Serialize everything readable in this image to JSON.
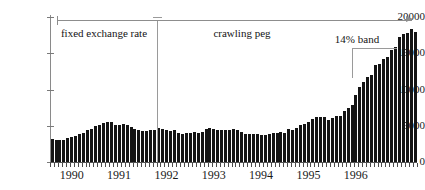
{
  "chart_data": {
    "type": "bar",
    "title": "",
    "subtitle": "",
    "xlabel": "",
    "ylabel": "",
    "xlim_labels": [
      "1990",
      "1996"
    ],
    "ylim": [
      0,
      20000
    ],
    "grid": false,
    "legend_position": "none",
    "y_ticks": [
      0,
      5000,
      10000,
      15000,
      20000
    ],
    "y_tick_labels": [
      "0",
      "5000",
      "10000",
      "15000",
      "20000"
    ],
    "x_tick_labels": [
      "1990",
      "1991",
      "1992",
      "1993",
      "1994",
      "1995",
      "1996"
    ],
    "x_tick_index": [
      0,
      12,
      24,
      36,
      48,
      60,
      72
    ],
    "bar_color": "#141414",
    "frequency": "monthly",
    "n_points": 80,
    "categories": [
      "1990-01",
      "1990-02",
      "1990-03",
      "1990-04",
      "1990-05",
      "1990-06",
      "1990-07",
      "1990-08",
      "1990-09",
      "1990-10",
      "1990-11",
      "1990-12",
      "1991-01",
      "1991-02",
      "1991-03",
      "1991-04",
      "1991-05",
      "1991-06",
      "1991-07",
      "1991-08",
      "1991-09",
      "1991-10",
      "1991-11",
      "1991-12",
      "1992-01",
      "1992-02",
      "1992-03",
      "1992-04",
      "1992-05",
      "1992-06",
      "1992-07",
      "1992-08",
      "1992-09",
      "1992-10",
      "1992-11",
      "1992-12",
      "1993-01",
      "1993-02",
      "1993-03",
      "1993-04",
      "1993-05",
      "1993-06",
      "1993-07",
      "1993-08",
      "1993-09",
      "1993-10",
      "1993-11",
      "1993-12",
      "1994-01",
      "1994-02",
      "1994-03",
      "1994-04",
      "1994-05",
      "1994-06",
      "1994-07",
      "1994-08",
      "1994-09",
      "1994-10",
      "1994-11",
      "1994-12",
      "1995-01",
      "1995-02",
      "1995-03",
      "1995-04",
      "1995-05",
      "1995-06",
      "1995-07",
      "1995-08",
      "1995-09",
      "1995-10",
      "1995-11",
      "1995-12",
      "1996-01",
      "1996-02",
      "1996-03",
      "1996-04",
      "1996-05",
      "1996-06",
      "1996-07",
      "1996-08"
    ],
    "values": [
      3200,
      3050,
      3050,
      3100,
      3300,
      3450,
      3550,
      3800,
      4050,
      4350,
      4600,
      4950,
      5150,
      5350,
      5550,
      5500,
      5100,
      5050,
      5200,
      5150,
      4850,
      4550,
      4350,
      4250,
      4300,
      4400,
      4450,
      4650,
      4600,
      4400,
      4300,
      4350,
      4050,
      3900,
      3950,
      4000,
      4100,
      4050,
      4100,
      4500,
      4750,
      4500,
      4400,
      4350,
      4350,
      4400,
      4500,
      4350,
      4150,
      3900,
      3850,
      3800,
      3850,
      3750,
      3700,
      3900,
      4000,
      4050,
      4200,
      4050,
      4500,
      4450,
      4700,
      5050,
      5250,
      5500,
      5950,
      6200,
      6250,
      6250,
      5800,
      6100,
      6350,
      6400,
      7050,
      7500,
      7850,
      9300,
      10300,
      11100
    ],
    "values_tail": [
      11700,
      12050,
      13350,
      13550,
      14150,
      14550,
      15500,
      15800,
      17250,
      17600,
      17850,
      18300,
      17950
    ],
    "annotations": [
      {
        "id": "fixed-exchange-rate",
        "label": "fixed exchange rate",
        "x_index": 11,
        "regime_start": 0,
        "regime_end": 23
      },
      {
        "id": "crawling-peg",
        "label": "crawling peg",
        "x_index": 47,
        "regime_start": 24,
        "regime_end": 92
      },
      {
        "id": "band-14-percent",
        "label": "14% band",
        "x_index": 77,
        "regime_start": 69,
        "regime_end": 92
      }
    ]
  },
  "annotation_text": {
    "fixed_exchange_rate": "fixed exchange rate",
    "crawling_peg": "crawling peg",
    "band_14": "14% band"
  }
}
